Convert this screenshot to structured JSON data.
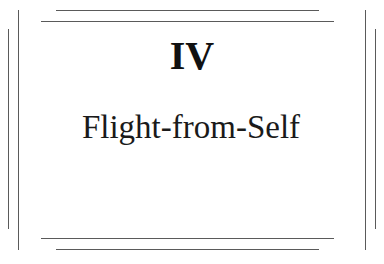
{
  "page": {
    "chapter_numeral": "IV",
    "chapter_title": "Flight-from-Self"
  },
  "colors": {
    "background": "#ffffff",
    "text": "#141414",
    "rules": "#5a5a5a"
  }
}
